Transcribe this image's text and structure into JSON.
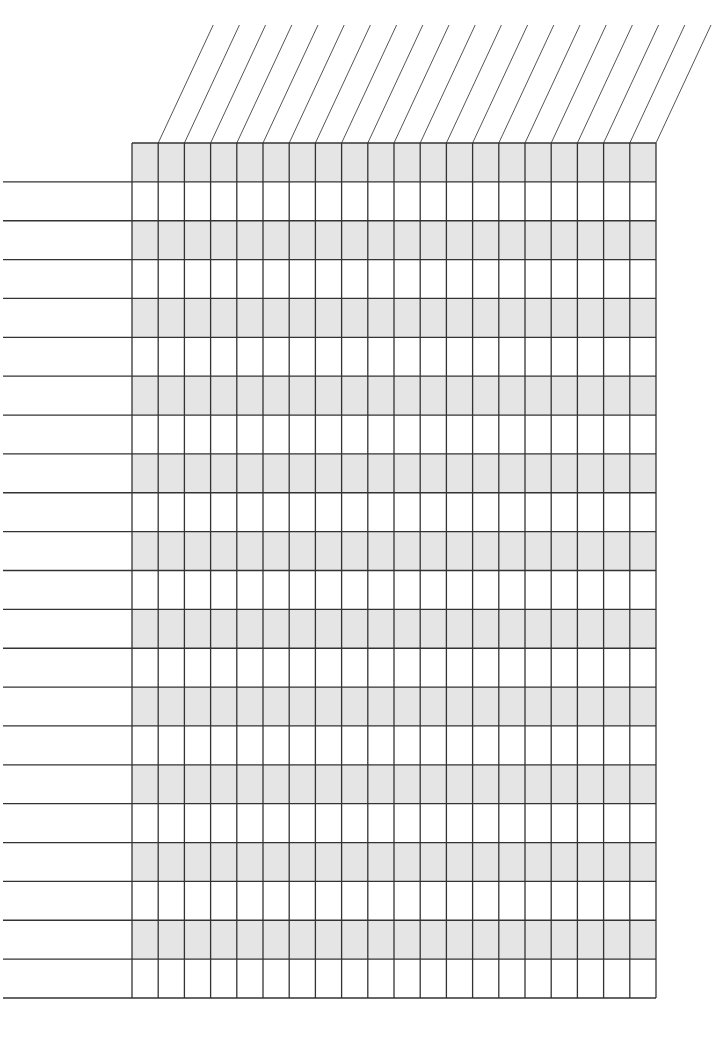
{
  "document": {
    "type": "blank-grid-template",
    "background_color": "#ffffff",
    "line_color": "#333333",
    "diagonal_color": "#555555",
    "shade_color": "#e5e5e5"
  },
  "grid": {
    "left": 132,
    "top": 143,
    "right": 656,
    "bottom": 998,
    "columns": 20,
    "rows": 22,
    "shaded_row_parity": "even"
  },
  "header_diagonals": {
    "count": 20,
    "start_y": 143,
    "end_y": 25,
    "dx": 55
  },
  "row_label_lines": {
    "x_start": 3,
    "x_end": 132,
    "count": 22
  }
}
